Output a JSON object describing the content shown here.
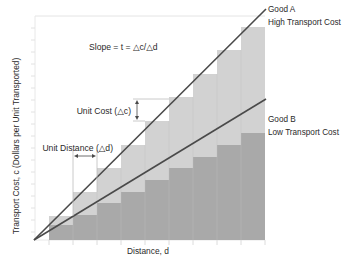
{
  "diagram": {
    "colors": {
      "background": "#ffffff",
      "good_a_fill": "#d2d2d2",
      "good_b_fill": "#a9a9a9",
      "line": "#4a4a4a",
      "grid": "#e4e4e4",
      "text": "#2a2a2a"
    },
    "formula": "Slope = t = △c/△d",
    "axes": {
      "x_label": "Distance, d",
      "y_label": "Transport Cost, c (Dollars per Unit Transported)"
    },
    "annotations": {
      "unit_cost": "Unit Cost (△c)",
      "unit_distance": "Unit Distance (△d)"
    },
    "series": [
      {
        "name": "Good A",
        "description": "High Transport Cost",
        "steps": 9,
        "relative_slope": 1.0
      },
      {
        "name": "Good B",
        "description": "Low Transport Cost",
        "steps": 9,
        "relative_slope": 0.6
      }
    ]
  }
}
